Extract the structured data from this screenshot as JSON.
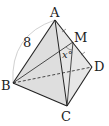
{
  "diagram": {
    "type": "tetrahedron",
    "vertices": {
      "A": {
        "label": "A",
        "x": 55,
        "y": 20
      },
      "B": {
        "label": "B",
        "x": 13,
        "y": 83
      },
      "C": {
        "label": "C",
        "x": 67,
        "y": 106
      },
      "D": {
        "label": "D",
        "x": 92,
        "y": 67
      },
      "M": {
        "label": "M",
        "x": 73,
        "y": 42
      }
    },
    "edge_length_label": "8",
    "angle_label": "x°",
    "colors": {
      "fill": "#dcdcdc",
      "stroke": "#222222",
      "arc": "#bbbbbb"
    }
  }
}
